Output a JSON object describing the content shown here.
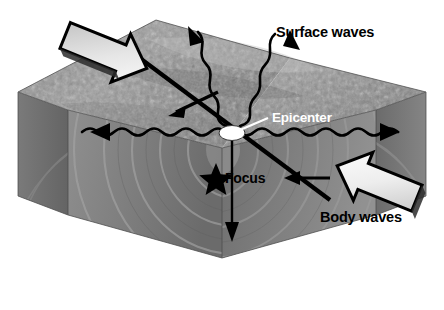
{
  "figure": {
    "kind": "earthquake-block-diagram",
    "background_color": "#ffffff"
  },
  "labels": {
    "surface_waves": "Surface waves",
    "epicenter": "Epicenter",
    "focus": "Focus",
    "body_waves": "Body waves"
  },
  "colors": {
    "background": "#ffffff",
    "label_dark": "#000000",
    "label_light": "#ffffff",
    "top_surface_light": "#b9b9b9",
    "top_surface_mid": "#8e8e8e",
    "top_surface_dark": "#6d6d6d",
    "front_face_light": "#8d8d8d",
    "front_face_mid": "#7a7a7a",
    "front_face_dark": "#636363",
    "side_face": "#6a6a6a",
    "wave_arc": "#9a9a9a",
    "arrow_fill_light": "#f2f2f2",
    "arrow_fill_dark": "#a8a8a8",
    "arrow_outline": "#000000",
    "epicenter_marker": "#ffffff",
    "focus_star": "#000000"
  },
  "markers": {
    "epicenter_marker_name": "epicenter-ellipse",
    "focus_marker_name": "focus-star"
  },
  "arrows": {
    "compression_left": "block-arrow-down-right",
    "compression_right": "block-arrow-up-left",
    "fault_slip_upper": "fault-slip-arrow-down-left",
    "fault_slip_lower": "fault-slip-arrow-left",
    "surface_wave_left": "wavy-arrow-left",
    "surface_wave_right": "wavy-arrow-right",
    "surface_wave_up_left": "wavy-arrow-up-left",
    "surface_wave_up_right": "wavy-arrow-up-right",
    "focus_down": "arrow-down"
  }
}
